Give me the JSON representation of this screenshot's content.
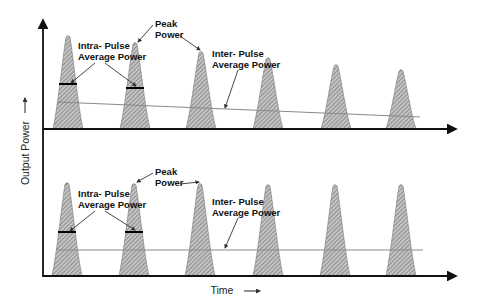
{
  "diagram": {
    "type": "pulse-power-diagram",
    "axes": {
      "y_label": "Output Power",
      "x_label": "Time"
    },
    "colors": {
      "axis": "#111111",
      "pulse_fill": "#b8b8b8",
      "pulse_hatch": "#6a6a6a",
      "inter_pulse_line": "#888888",
      "intra_bar": "#000000"
    },
    "panels": [
      {
        "name": "top",
        "description": "Pulse train with decaying peak power",
        "labels": {
          "peak": [
            "Peak",
            "Power"
          ],
          "intra": [
            "Intra- Pulse",
            "Average Power"
          ],
          "inter": [
            "Inter- Pulse",
            "Average Power"
          ]
        },
        "pulses": [
          {
            "x": 68,
            "peak_y": 35
          },
          {
            "x": 135,
            "peak_y": 42
          },
          {
            "x": 201,
            "peak_y": 51
          },
          {
            "x": 268,
            "peak_y": 57
          },
          {
            "x": 336,
            "peak_y": 64
          },
          {
            "x": 401,
            "peak_y": 69
          }
        ],
        "baseline_y": 129,
        "inter_pulse_line": {
          "x1": 57,
          "y1": 102,
          "x2": 420,
          "y2": 117
        }
      },
      {
        "name": "bottom",
        "description": "Pulse train with constant peak power",
        "labels": {
          "peak": [
            "Peak",
            "Power"
          ],
          "intra": [
            "Intra- Pulse",
            "Average Power"
          ],
          "inter": [
            "Inter- Pulse",
            "Average Power"
          ]
        },
        "pulses": [
          {
            "x": 67,
            "peak_y": 182
          },
          {
            "x": 134,
            "peak_y": 183
          },
          {
            "x": 200,
            "peak_y": 183
          },
          {
            "x": 268,
            "peak_y": 184
          },
          {
            "x": 335,
            "peak_y": 184
          },
          {
            "x": 401,
            "peak_y": 184
          }
        ],
        "baseline_y": 276,
        "inter_pulse_line": {
          "x1": 57,
          "y1": 250,
          "x2": 423,
          "y2": 250
        }
      }
    ]
  }
}
